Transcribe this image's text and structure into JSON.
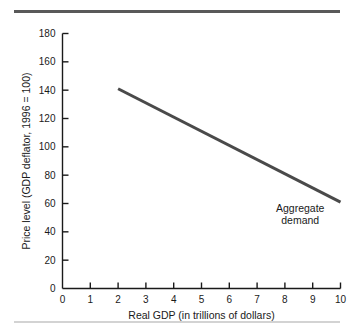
{
  "chart_data": {
    "type": "line",
    "title": "",
    "xlabel": "Real GDP (in trillions of dollars)",
    "ylabel": "Price level (GDP deflator, 1996 = 100)",
    "xlim": [
      0,
      10
    ],
    "ylim": [
      0,
      180
    ],
    "xticks": [
      0,
      1,
      2,
      3,
      4,
      5,
      6,
      7,
      8,
      9,
      10
    ],
    "xtick_labels": [
      "0",
      "1",
      "2",
      "3",
      "4",
      "5",
      "6",
      "7",
      "8",
      "9",
      "10"
    ],
    "yticks": [
      0,
      20,
      40,
      60,
      80,
      100,
      120,
      140,
      160,
      180
    ],
    "ytick_labels": [
      "0",
      "20",
      "40",
      "60",
      "80",
      "100",
      "120",
      "140",
      "160",
      "180"
    ],
    "grid": false,
    "legend_position": "none",
    "series": [
      {
        "name": "Aggregate demand",
        "color": "#4a4a4a",
        "line_width": 3,
        "x": [
          2,
          10
        ],
        "values": [
          141,
          61
        ]
      }
    ],
    "annotations": [
      {
        "name": "aggregate-demand-label",
        "line1": "Aggregate",
        "line2": "demand",
        "x": 8.55,
        "y": 54
      }
    ]
  },
  "figure": {
    "top_rule_color": "#595959",
    "bottom_rule_color": "#d3d3d3",
    "background": "#ffffff",
    "axis_color": "#1a1a1a"
  }
}
